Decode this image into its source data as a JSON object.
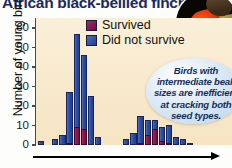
{
  "title": "African black-bellied finches",
  "photo": {
    "alt": "finch-with-red-beak-on-perch"
  },
  "legend": {
    "items": [
      {
        "label": "Survived",
        "color": "#8b1552",
        "key": "survived"
      },
      {
        "label": "Did not survive",
        "color": "#2d50a6",
        "key": "did_not_survive"
      }
    ]
  },
  "callout": {
    "text": "Birds with intermediate beak sizes are inefficient at cracking both seed types."
  },
  "axes": {
    "y_title": "Number of young birds",
    "y_ticks": [
      "0",
      "10",
      "20",
      "30",
      "40",
      "50",
      "60"
    ],
    "x_title": ""
  },
  "chart_data": {
    "type": "bar",
    "title": "African black-bellied finches",
    "xlabel": "Beak size",
    "ylabel": "Number of young birds",
    "ylim": [
      0,
      65
    ],
    "grid": false,
    "stacked": true,
    "legend_position": "top-center",
    "bar_colors": {
      "survived": "#8b1552",
      "did_not_survive": "#2d50a6"
    },
    "categories": [
      "1",
      "2",
      "3",
      "4",
      "5",
      "6",
      "7",
      "8",
      "9",
      "10",
      "11",
      "12",
      "13",
      "14",
      "15",
      "16",
      "17",
      "18",
      "19",
      "20",
      "21",
      "22",
      "23",
      "24"
    ],
    "series": [
      {
        "name": "Survived",
        "values": [
          0,
          0,
          0,
          0,
          1,
          9,
          8,
          0,
          0,
          0,
          0,
          0,
          0,
          0,
          1,
          5,
          8,
          2,
          1,
          0,
          0,
          0,
          0,
          0
        ]
      },
      {
        "name": "Did not survive",
        "values": [
          2,
          0,
          3,
          5,
          26,
          48,
          38,
          25,
          4,
          0,
          0,
          0,
          3,
          6,
          14,
          8,
          5,
          7,
          9,
          4,
          3,
          1,
          0,
          0
        ]
      }
    ],
    "totals": [
      2,
      0,
      3,
      5,
      27,
      57,
      46,
      25,
      4,
      0,
      0,
      0,
      3,
      6,
      15,
      13,
      13,
      9,
      10,
      4,
      3,
      1,
      0,
      0
    ],
    "annotations": [
      {
        "text": "Birds with intermediate beak sizes are inefficient at cracking both seed types.",
        "type": "callout"
      }
    ]
  }
}
